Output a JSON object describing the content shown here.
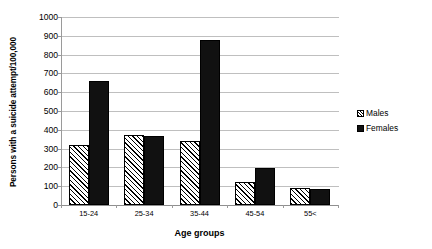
{
  "chart_data": {
    "type": "bar",
    "title": "",
    "categories": [
      "15-24",
      "25-34",
      "35-44",
      "45-54",
      "55<"
    ],
    "series": [
      {
        "name": "Males",
        "values": [
          320,
          370,
          340,
          125,
          90
        ]
      },
      {
        "name": "Females",
        "values": [
          660,
          365,
          880,
          195,
          85
        ]
      }
    ],
    "xlabel": "Age groups",
    "ylabel": "Persons with a suicide attempt/100,000",
    "ylim": [
      0,
      1000
    ],
    "ytick_step": 100,
    "yticks": [
      "1000",
      "900",
      "800",
      "700",
      "600",
      "500",
      "400",
      "300",
      "200",
      "100",
      "0"
    ],
    "grid": "horizontal",
    "legend_position": "right",
    "colors": {
      "males": "#ffffff",
      "males_hatch": "#000000",
      "females": "#111111",
      "gridline": "#bfbfbf",
      "axis": "#9a9a9a",
      "background": "#ffffff"
    }
  },
  "legend": {
    "items": [
      {
        "label": "Males",
        "marker": "hatched-swatch"
      },
      {
        "label": "Females",
        "marker": "solid-black-swatch"
      }
    ]
  }
}
